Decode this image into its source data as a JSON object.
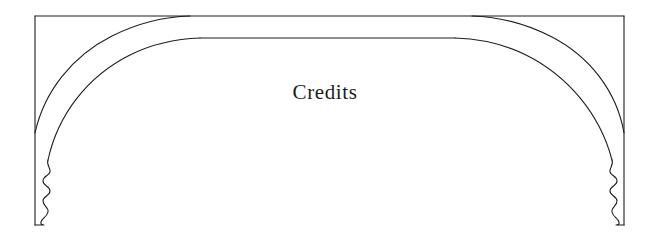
{
  "page": {
    "kind": "book-page-decoration",
    "title": "Credits",
    "width": 650,
    "height": 240,
    "background_color": "#ffffff",
    "ink_color": "#1d1d1d"
  },
  "ornament": {
    "name": "tudor-arch-ornament",
    "description": "Flattened four-centred arch band inside a rectangular frame with ogee finials",
    "stroke_color": "#1d1d1d",
    "stroke_width": 1.1,
    "frame": {
      "left": 35,
      "top": 15,
      "right": 624,
      "bottom": 225
    },
    "outer_arch": {
      "springing_left": {
        "x": 35,
        "y": 133
      },
      "crown_left": {
        "x": 190,
        "y": 16
      },
      "crown_right": {
        "x": 472,
        "y": 16
      },
      "springing_right": {
        "x": 624,
        "y": 133
      }
    },
    "inner_arch": {
      "springing_left": {
        "x": 48,
        "y": 160
      },
      "crown_left": {
        "x": 200,
        "y": 38
      },
      "crown_right": {
        "x": 455,
        "y": 38
      },
      "springing_right": {
        "x": 612,
        "y": 160
      }
    },
    "finials": [
      {
        "side": "left",
        "x": 35,
        "top": 160,
        "bottom": 225
      },
      {
        "side": "right",
        "x": 624,
        "top": 160,
        "bottom": 225
      }
    ]
  }
}
